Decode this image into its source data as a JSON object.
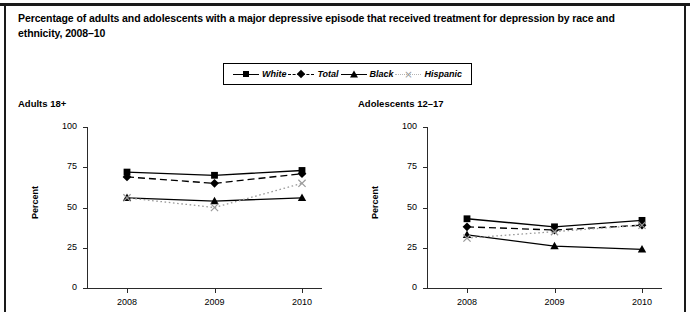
{
  "figure": {
    "title": "Percentage of adults and adolescents with a major depressive episode that received treatment for depression by race and ethnicity, 2008–10"
  },
  "legend": {
    "items": [
      {
        "label": "White",
        "marker": "square",
        "line": "solid",
        "color": "#000000"
      },
      {
        "label": "Total",
        "marker": "diamond",
        "line": "dashed",
        "color": "#000000"
      },
      {
        "label": "Black",
        "marker": "triangle",
        "line": "solid",
        "color": "#000000"
      },
      {
        "label": "Hispanic",
        "marker": "cross",
        "line": "dotted",
        "color": "#9a9a9a"
      }
    ]
  },
  "panels": [
    {
      "key": "adults",
      "title": "Adults 18+",
      "ylabel": "Percent",
      "ytick_labels": [
        "100",
        "75",
        "50",
        "25",
        "0"
      ],
      "xtick_labels": [
        "2008",
        "2009",
        "2010"
      ]
    },
    {
      "key": "adolescents",
      "title": "Adolescents 12–17",
      "ylabel": "Percent",
      "ytick_labels": [
        "100",
        "75",
        "50",
        "25",
        "0"
      ],
      "xtick_labels": [
        "2008",
        "2009",
        "2010"
      ]
    }
  ],
  "chart_data": [
    {
      "type": "line",
      "title": "Adults 18+",
      "subtitle": "Percentage of adults with a major depressive episode that received treatment for depression by race and ethnicity, 2008–10",
      "xlabel": "",
      "ylabel": "Percent",
      "categories": [
        "2008",
        "2009",
        "2010"
      ],
      "ylim": [
        0,
        100
      ],
      "yticks": [
        0,
        25,
        50,
        75,
        100
      ],
      "grid": false,
      "legend_position": "top-center",
      "series": [
        {
          "name": "White",
          "values": [
            72,
            70,
            73
          ],
          "marker": "square",
          "line": "solid",
          "color": "#000000"
        },
        {
          "name": "Total",
          "values": [
            69,
            65,
            71
          ],
          "marker": "diamond",
          "line": "dashed",
          "color": "#000000"
        },
        {
          "name": "Black",
          "values": [
            56,
            54,
            56
          ],
          "marker": "triangle",
          "line": "solid",
          "color": "#000000"
        },
        {
          "name": "Hispanic",
          "values": [
            56,
            50,
            65
          ],
          "marker": "cross",
          "line": "dotted",
          "color": "#9a9a9a"
        }
      ]
    },
    {
      "type": "line",
      "title": "Adolescents 12–17",
      "subtitle": "Percentage of adolescents with a major depressive episode that received treatment for depression by race and ethnicity, 2008–10",
      "xlabel": "",
      "ylabel": "Percent",
      "categories": [
        "2008",
        "2009",
        "2010"
      ],
      "ylim": [
        0,
        100
      ],
      "yticks": [
        0,
        25,
        50,
        75,
        100
      ],
      "grid": false,
      "legend_position": "top-center",
      "series": [
        {
          "name": "White",
          "values": [
            43,
            38,
            42
          ],
          "marker": "square",
          "line": "solid",
          "color": "#000000"
        },
        {
          "name": "Total",
          "values": [
            38,
            36,
            39
          ],
          "marker": "diamond",
          "line": "dashed",
          "color": "#000000"
        },
        {
          "name": "Black",
          "values": [
            33,
            26,
            24
          ],
          "marker": "triangle",
          "line": "solid",
          "color": "#000000"
        },
        {
          "name": "Hispanic",
          "values": [
            31,
            35,
            39
          ],
          "marker": "cross",
          "line": "dotted",
          "color": "#9a9a9a"
        }
      ]
    }
  ]
}
